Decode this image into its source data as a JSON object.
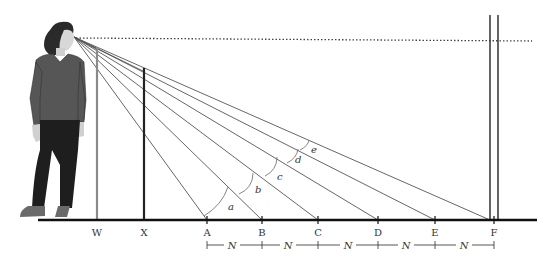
{
  "figure": {
    "type": "perspective-viewing-diagram",
    "observer": "standing woman looking toward the horizon",
    "eye_point": [
      74,
      37
    ],
    "horizon_line": {
      "style": "dotted",
      "y": 40
    },
    "ground_line": {
      "y": 220
    }
  },
  "poles": [
    {
      "label": "W",
      "x": 97,
      "top": 47,
      "color": "#8a8a8a"
    },
    {
      "label": "X",
      "x": 144,
      "top": 68,
      "color": "#222222"
    }
  ],
  "points": [
    {
      "label": "A",
      "x": 207
    },
    {
      "label": "B",
      "x": 262
    },
    {
      "label": "C",
      "x": 318
    },
    {
      "label": "D",
      "x": 378
    },
    {
      "label": "E",
      "x": 435
    },
    {
      "label": "F",
      "x": 493
    }
  ],
  "angles": [
    {
      "label": "a",
      "at": "A"
    },
    {
      "label": "b",
      "at": "B"
    },
    {
      "label": "c",
      "at": "C"
    },
    {
      "label": "d",
      "at": "D"
    },
    {
      "label": "e",
      "at": "E"
    }
  ],
  "spacing": {
    "label": "N",
    "segments": [
      "A-B",
      "B-C",
      "C-D",
      "D-E",
      "E-F"
    ]
  },
  "far_marker": {
    "label": "F",
    "type": "double-vertical-line"
  },
  "text": {
    "W": "W",
    "X": "X",
    "A": "A",
    "B": "B",
    "C": "C",
    "D": "D",
    "E": "E",
    "F": "F",
    "a": "a",
    "b": "b",
    "c": "c",
    "d": "d",
    "e": "e",
    "N": "N"
  }
}
